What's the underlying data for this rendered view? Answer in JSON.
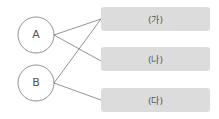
{
  "nodes": [
    {
      "label": "A"
    },
    {
      "label": "B"
    }
  ],
  "boxes": [
    {
      "label": "(가)"
    },
    {
      "label": "(나)"
    },
    {
      "label": "(다)"
    }
  ],
  "connections": [
    {
      "from": "A",
      "to": "(가)"
    },
    {
      "from": "A",
      "to": "(나)"
    },
    {
      "from": "B",
      "to": "(가)"
    },
    {
      "from": "B",
      "to": "(다)"
    }
  ],
  "colors": {
    "box": "#dcdcdc",
    "line": "#666666"
  }
}
